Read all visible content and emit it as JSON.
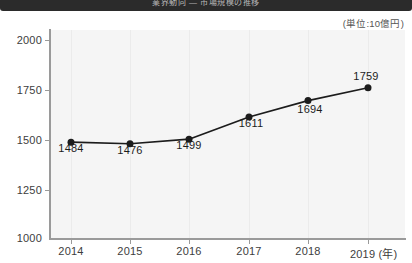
{
  "banner": {
    "title": "業界動向 — 市場規模の推移"
  },
  "unit_note": "(単位:10億円)",
  "chart_data": {
    "type": "line",
    "title": "",
    "subtitle": "",
    "xlabel": "(年)",
    "ylabel": "",
    "unit": "(単位:10億円)",
    "categories": [
      "2014",
      "2015",
      "2016",
      "2017",
      "2018",
      "2019"
    ],
    "x_tick_labels": [
      "2014",
      "2015",
      "2016",
      "2017",
      "2018",
      "2019 (年)"
    ],
    "values": [
      1484,
      1476,
      1499,
      1611,
      1694,
      1759
    ],
    "point_labels": [
      "1484",
      "1476",
      "1499",
      "1611",
      "1694",
      "1759"
    ],
    "point_label_positions": [
      "below",
      "below",
      "below",
      "below",
      "above",
      "above"
    ],
    "ylim": [
      1000,
      2000
    ],
    "y_ticks": [
      2000,
      1750,
      1500,
      1250,
      1000
    ],
    "y_tick_labels": [
      "2000",
      "1750",
      "1500",
      "1250",
      "1000"
    ],
    "grid": "vertical",
    "legend": "none",
    "marker": "filled-circle",
    "series": [
      {
        "name": "市場規模",
        "values": [
          1484,
          1476,
          1499,
          1611,
          1694,
          1759
        ],
        "color": "#1c1c1c"
      }
    ]
  },
  "colors": {
    "banner": "#2b2b2b",
    "plot_background": "#f5f5f5",
    "axis": "#9a9a9a",
    "gridline": "#ebebeb",
    "line": "#1c1c1c",
    "label_text": "#3d3d3d"
  }
}
